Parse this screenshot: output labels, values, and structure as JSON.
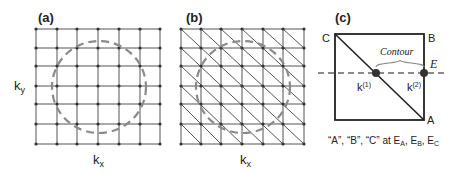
{
  "panels": {
    "a": {
      "label": "(a)",
      "xlabel": "k",
      "xlabel_sub": "x",
      "ylabel": "k",
      "ylabel_sub": "y"
    },
    "b": {
      "label": "(b)",
      "xlabel": "k",
      "xlabel_sub": "x"
    },
    "c": {
      "label": "(c)",
      "corner_c": "C",
      "corner_b": "B",
      "corner_a": "A",
      "energy_label": "E",
      "contour_label": "Contour",
      "k1": "k",
      "k1_sup": "(1)",
      "k2": "k",
      "k2_sup": "(2)",
      "caption": "“A”, “B”, “C” at E",
      "caption_sub_a": "A",
      "caption_sep1": ", E",
      "caption_sub_b": "B",
      "caption_sep2": ", E",
      "caption_sub_c": "C"
    }
  },
  "colors": {
    "grid": "#555555",
    "dashed": "#8a8a8a",
    "node": "#333333",
    "dot": "#333333"
  }
}
